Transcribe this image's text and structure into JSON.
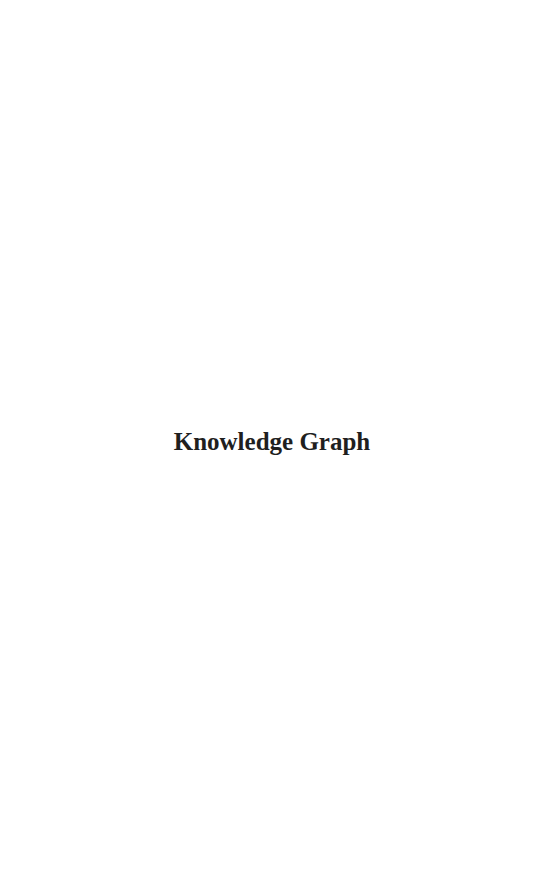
{
  "page": {
    "title": "Knowledge Graph",
    "background_color": "#ffffff",
    "text_color": "#1f1f1f"
  }
}
